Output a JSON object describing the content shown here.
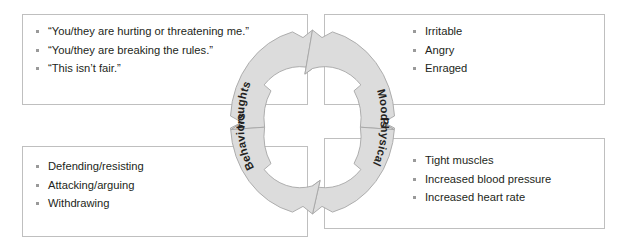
{
  "diagram": {
    "type": "cycle",
    "ring": {
      "fill_color": "#dcdcdc",
      "stroke_color": "#a6a6a6",
      "segments": [
        {
          "id": "thoughts",
          "label": "Thoughts"
        },
        {
          "id": "moods",
          "label": "Moods"
        },
        {
          "id": "physical",
          "label": "Physical"
        },
        {
          "id": "behaviors",
          "label": "Behaviors"
        }
      ]
    },
    "boxes": [
      {
        "id": "thoughts",
        "position": "top-left",
        "items": [
          "“You/they are hurting or threatening me.”",
          "“You/they are breaking the rules.”",
          "“This isn’t fair.”"
        ]
      },
      {
        "id": "moods",
        "position": "top-right",
        "items": [
          "Irritable",
          "Angry",
          "Enraged"
        ]
      },
      {
        "id": "behaviors",
        "position": "bottom-left",
        "items": [
          "Defending/resisting",
          "Attacking/arguing",
          "Withdrawing"
        ]
      },
      {
        "id": "physical",
        "position": "bottom-right",
        "items": [
          "Tight muscles",
          "Increased blood pressure",
          "Increased heart rate"
        ]
      }
    ]
  },
  "colors": {
    "text": "#231f20",
    "bullet": "#9a9a9a",
    "box_border": "#bfbfbf",
    "ring_fill": "#dcdcdc",
    "ring_stroke": "#a6a6a6",
    "background": "#ffffff"
  }
}
